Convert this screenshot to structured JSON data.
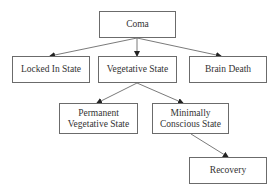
{
  "diagram": {
    "type": "flowchart",
    "nodes": [
      {
        "id": "coma",
        "label": "Coma",
        "x": 99,
        "y": 11,
        "w": 77,
        "h": 27
      },
      {
        "id": "locked",
        "label": "Locked In State",
        "x": 12,
        "y": 56,
        "w": 78,
        "h": 27
      },
      {
        "id": "vegetative",
        "label": "Vegetative State",
        "x": 98,
        "y": 56,
        "w": 79,
        "h": 27
      },
      {
        "id": "brain_death",
        "label": "Brain Death",
        "x": 189,
        "y": 56,
        "w": 78,
        "h": 27
      },
      {
        "id": "permanent",
        "label": "Permanent Vegetative State",
        "line1": "Permanent",
        "line2": "Vegetative State",
        "x": 59,
        "y": 103,
        "w": 79,
        "h": 31
      },
      {
        "id": "minimally",
        "label": "Minimally Conscious State",
        "line1": "Minimally",
        "line2": "Conscious State",
        "x": 152,
        "y": 103,
        "w": 77,
        "h": 31
      },
      {
        "id": "recovery",
        "label": "Recovery",
        "x": 189,
        "y": 157,
        "w": 78,
        "h": 27
      }
    ],
    "edges": [
      {
        "from": "coma",
        "to": "locked",
        "x1": 137,
        "y1": 38,
        "x2": 50,
        "y2": 56
      },
      {
        "from": "coma",
        "to": "vegetative",
        "x1": 137,
        "y1": 38,
        "x2": 137,
        "y2": 56
      },
      {
        "from": "coma",
        "to": "brain_death",
        "x1": 137,
        "y1": 38,
        "x2": 221,
        "y2": 56
      },
      {
        "from": "vegetative",
        "to": "permanent",
        "x1": 137,
        "y1": 83,
        "x2": 97,
        "y2": 103
      },
      {
        "from": "vegetative",
        "to": "minimally",
        "x1": 137,
        "y1": 83,
        "x2": 183,
        "y2": 103
      },
      {
        "from": "minimally",
        "to": "recovery",
        "x1": 191,
        "y1": 134,
        "x2": 228,
        "y2": 157
      }
    ],
    "colors": {
      "stroke": "#6b6b6b",
      "arrow": "#222222",
      "text": "#333333",
      "background": "#ffffff"
    }
  }
}
